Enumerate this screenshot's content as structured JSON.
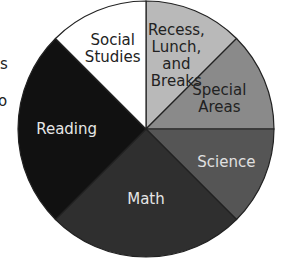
{
  "chart_data": {
    "type": "pie",
    "title": "",
    "start_angle_deg": 0,
    "direction": "clockwise",
    "slices": [
      {
        "label": "Recess,\nLunch,\nand\nBreaks",
        "value": 12.5,
        "color": "#b9b9b9",
        "text_color": "#222222"
      },
      {
        "label": "Special\nAreas",
        "value": 12.5,
        "color": "#8a8a8a",
        "text_color": "#222222"
      },
      {
        "label": "Science",
        "value": 12.5,
        "color": "#555555",
        "text_color": "#e0e0e0"
      },
      {
        "label": "Math",
        "value": 25,
        "color": "#2f2f2f",
        "text_color": "#e6e6e6"
      },
      {
        "label": "Reading",
        "value": 25,
        "color": "#111111",
        "text_color": "#e6e6e6"
      },
      {
        "label": "Social\nStudies",
        "value": 12.5,
        "color": "#ffffff",
        "text_color": "#222222"
      }
    ],
    "legend": "none (labels inside slices)"
  },
  "edge_text": [
    "s",
    "o"
  ]
}
